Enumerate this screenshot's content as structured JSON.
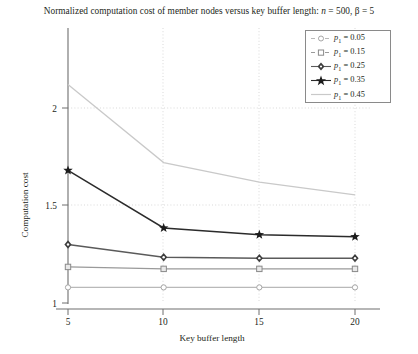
{
  "chart_data": {
    "type": "line",
    "title": "Normalized computation cost of member nodes versus key buffer length: n = 500, β = 5",
    "title_plain": "Normalized computation cost of member nodes versus key buffer length: n = 500, beta = 5",
    "xlabel": "Key buffer length",
    "ylabel": "Computation cost",
    "x": [
      5,
      10,
      15,
      20
    ],
    "xticks": [
      "5",
      "10",
      "15",
      "20"
    ],
    "yticks": [
      "1",
      "1.5",
      "2"
    ],
    "ytick_values": [
      1,
      1.5,
      2
    ],
    "xlim": [
      5,
      20
    ],
    "ylim": [
      0.97,
      2.28
    ],
    "grid": "dotted",
    "legend_position": "top-right",
    "series": [
      {
        "name": "p₁ = 0.05",
        "label_base": "p",
        "label_sub": "1",
        "label_value": "= 0.05",
        "values": [
          1.08,
          1.08,
          1.08,
          1.08
        ],
        "marker": "circle-open",
        "color": "#b9b9b9"
      },
      {
        "name": "p₁ = 0.15",
        "label_base": "p",
        "label_sub": "1",
        "label_value": "= 0.15",
        "values": [
          1.185,
          1.175,
          1.175,
          1.175
        ],
        "marker": "square-open",
        "color": "#9a9a9a"
      },
      {
        "name": "p₁ = 0.25",
        "label_base": "p",
        "label_sub": "1",
        "label_value": "= 0.25",
        "values": [
          1.3,
          1.235,
          1.23,
          1.23
        ],
        "marker": "diamond-filled",
        "color": "#5a5a5a"
      },
      {
        "name": "p₁ = 0.35",
        "label_base": "p",
        "label_sub": "1",
        "label_value": "= 0.35",
        "values": [
          1.68,
          1.385,
          1.35,
          1.34
        ],
        "marker": "star-filled",
        "color": "#2b2b2b"
      },
      {
        "name": "p₁ = 0.45",
        "label_base": "p",
        "label_sub": "1",
        "label_value": "= 0.45",
        "values": [
          2.12,
          1.72,
          1.62,
          1.555
        ],
        "marker": "none",
        "color": "#c9c9c9"
      }
    ]
  },
  "title": {
    "part1": "Normalized computation cost of member nodes versus key buffer length: ",
    "n_sym": "n",
    "n_eq": " = 500, ",
    "beta_sym": "β",
    "beta_eq": " = 5"
  },
  "axes": {
    "x_label": "Key buffer length",
    "y_label": "Computation cost",
    "x_ticks": [
      "5",
      "10",
      "15",
      "20"
    ],
    "y_ticks": [
      "1",
      "1.5",
      "2"
    ]
  },
  "legend": {
    "items": [
      {
        "base": "p",
        "sub": "1",
        "rest": " = 0.05"
      },
      {
        "base": "p",
        "sub": "1",
        "rest": " = 0.15"
      },
      {
        "base": "p",
        "sub": "1",
        "rest": " = 0.25"
      },
      {
        "base": "p",
        "sub": "1",
        "rest": " = 0.35"
      },
      {
        "base": "p",
        "sub": "1",
        "rest": " = 0.45"
      }
    ]
  }
}
